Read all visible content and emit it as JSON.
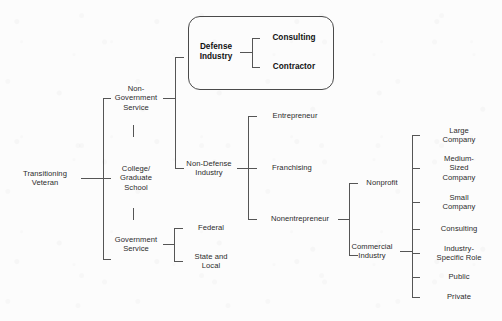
{
  "diagram": {
    "type": "tree-diagram",
    "background_color": "#fcfcfc",
    "line_color": "#555555",
    "text_color": "#2b2b2b",
    "highlight_box": {
      "name": "defense-industry-group",
      "style": "rounded-rectangle",
      "border_color": "#4a4a4a",
      "bold": true
    },
    "nodes": {
      "root": "Transitioning\nVeteran",
      "non_government_service": "Non-\nGovernment\nService",
      "college_graduate_school": "College/\nGraduate\nSchool",
      "government_service": "Government\nService",
      "defense_industry": "Defense\nIndustry",
      "consulting_defense": "Consulting",
      "contractor": "Contractor",
      "non_defense_industry": "Non-Defense\nIndustry",
      "entrepreneur": "Entrepreneur",
      "franchising": "Franchising",
      "nonentrepreneur": "Nonentrepreneur",
      "federal": "Federal",
      "state_and_local": "State and\nLocal",
      "nonprofit": "Nonprofit",
      "commercial_industry": "Commercial\nIndustry",
      "large_company": "Large\nCompany",
      "medium_sized_company": "Medium-\nSized\nCompany",
      "small_company": "Small\nCompany",
      "consulting_commercial": "Consulting",
      "industry_specific_role": "Industry-\nSpecific Role",
      "public": "Public",
      "private": "Private"
    },
    "hierarchy": [
      {
        "label": "Transitioning Veteran",
        "children": [
          {
            "label": "Non-Government Service",
            "children": [
              {
                "label": "Defense Industry",
                "highlighted": true,
                "children": [
                  {
                    "label": "Consulting"
                  },
                  {
                    "label": "Contractor"
                  }
                ]
              },
              {
                "label": "Non-Defense Industry",
                "children": [
                  {
                    "label": "Entrepreneur"
                  },
                  {
                    "label": "Franchising"
                  },
                  {
                    "label": "Nonentrepreneur",
                    "children": [
                      {
                        "label": "Nonprofit"
                      },
                      {
                        "label": "Commercial Industry",
                        "children": [
                          {
                            "label": "Large Company"
                          },
                          {
                            "label": "Medium-Sized Company"
                          },
                          {
                            "label": "Small Company"
                          },
                          {
                            "label": "Consulting"
                          },
                          {
                            "label": "Industry-Specific Role"
                          },
                          {
                            "label": "Public"
                          },
                          {
                            "label": "Private"
                          }
                        ]
                      }
                    ]
                  }
                ]
              }
            ]
          },
          {
            "label": "College/Graduate School"
          },
          {
            "label": "Government Service",
            "children": [
              {
                "label": "Federal"
              },
              {
                "label": "State and Local"
              }
            ]
          }
        ]
      }
    ]
  }
}
